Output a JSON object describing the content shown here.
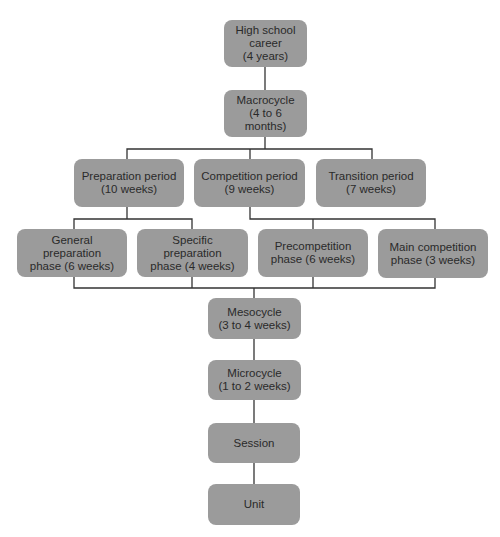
{
  "diagram": {
    "type": "hierarchy",
    "box_color": "#9b9b9b",
    "line_color": "#333333",
    "nodes": {
      "career": {
        "label": "High school\ncareer\n(4 years)"
      },
      "macrocycle": {
        "label": "Macrocycle\n(4 to 6 months)"
      },
      "preparation_period": {
        "label": "Preparation period\n(10 weeks)"
      },
      "competition_period": {
        "label": "Competition period\n(9 weeks)"
      },
      "transition_period": {
        "label": "Transition period\n(7 weeks)"
      },
      "general_prep_phase": {
        "label": "General\npreparation\nphase (6 weeks)"
      },
      "specific_prep_phase": {
        "label": "Specific\npreparation\nphase (4 weeks)"
      },
      "precompetition_phase": {
        "label": "Precompetition\nphase (6 weeks)"
      },
      "main_competition_phase": {
        "label": "Main competition\nphase (3 weeks)"
      },
      "mesocycle": {
        "label": "Mesocycle\n(3 to 4 weeks)"
      },
      "microcycle": {
        "label": "Microcycle\n(1 to 2 weeks)"
      },
      "session": {
        "label": "Session"
      },
      "unit": {
        "label": "Unit"
      }
    },
    "edges": [
      [
        "career",
        "macrocycle"
      ],
      [
        "macrocycle",
        "preparation_period"
      ],
      [
        "macrocycle",
        "competition_period"
      ],
      [
        "macrocycle",
        "transition_period"
      ],
      [
        "preparation_period",
        "general_prep_phase"
      ],
      [
        "preparation_period",
        "specific_prep_phase"
      ],
      [
        "competition_period",
        "precompetition_phase"
      ],
      [
        "competition_period",
        "main_competition_phase"
      ],
      [
        "general_prep_phase",
        "mesocycle"
      ],
      [
        "specific_prep_phase",
        "mesocycle"
      ],
      [
        "precompetition_phase",
        "mesocycle"
      ],
      [
        "main_competition_phase",
        "mesocycle"
      ],
      [
        "mesocycle",
        "microcycle"
      ],
      [
        "microcycle",
        "session"
      ],
      [
        "session",
        "unit"
      ]
    ]
  }
}
